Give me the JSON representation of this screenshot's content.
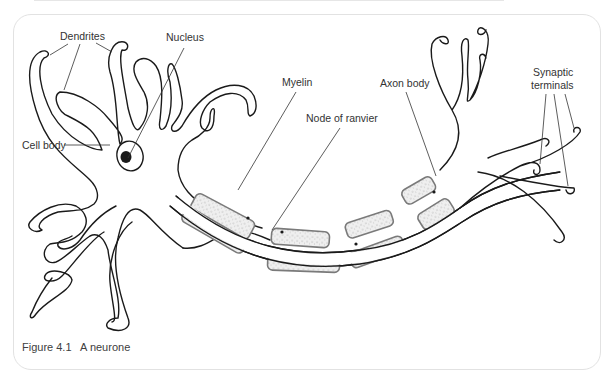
{
  "figure": {
    "number": "Figure 4.1",
    "title": "A neurone"
  },
  "labels": {
    "dendrites": "Dendrites",
    "nucleus": "Nucleus",
    "cell_body": "Cell body",
    "myelin": "Myelin",
    "axon_body": "Axon body",
    "node_of_ranvier": "Node of ranvier",
    "synaptic_terminals_line1": "Synaptic",
    "synaptic_terminals_line2": "terminals"
  },
  "colors": {
    "outline": "#1a1a1a",
    "myelin_fill": "#ececec",
    "myelin_border": "#7a7a7a",
    "leader": "#333333",
    "text": "#333333"
  }
}
